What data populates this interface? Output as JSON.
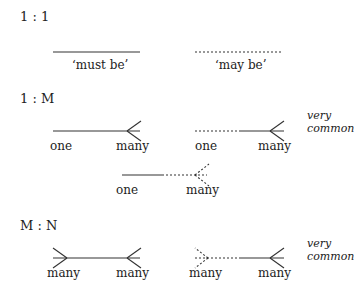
{
  "sections": {
    "one_to_one": {
      "heading": "1 : 1",
      "must_label": "‘must be’",
      "may_label": "‘may be’"
    },
    "one_to_many": {
      "heading": "1 : M",
      "a_left": "one",
      "a_right": "many",
      "b_left": "one",
      "b_right": "many",
      "c_left": "one",
      "c_right": "many",
      "note_line1": "very",
      "note_line2": "common"
    },
    "many_to_many": {
      "heading": "M : N",
      "a_left": "many",
      "a_right": "many",
      "b_left": "many",
      "b_right": "many",
      "note_line1": "very",
      "note_line2": "common"
    }
  },
  "colors": {
    "line": "#333333",
    "text": "#222222",
    "background": "#ffffff"
  }
}
